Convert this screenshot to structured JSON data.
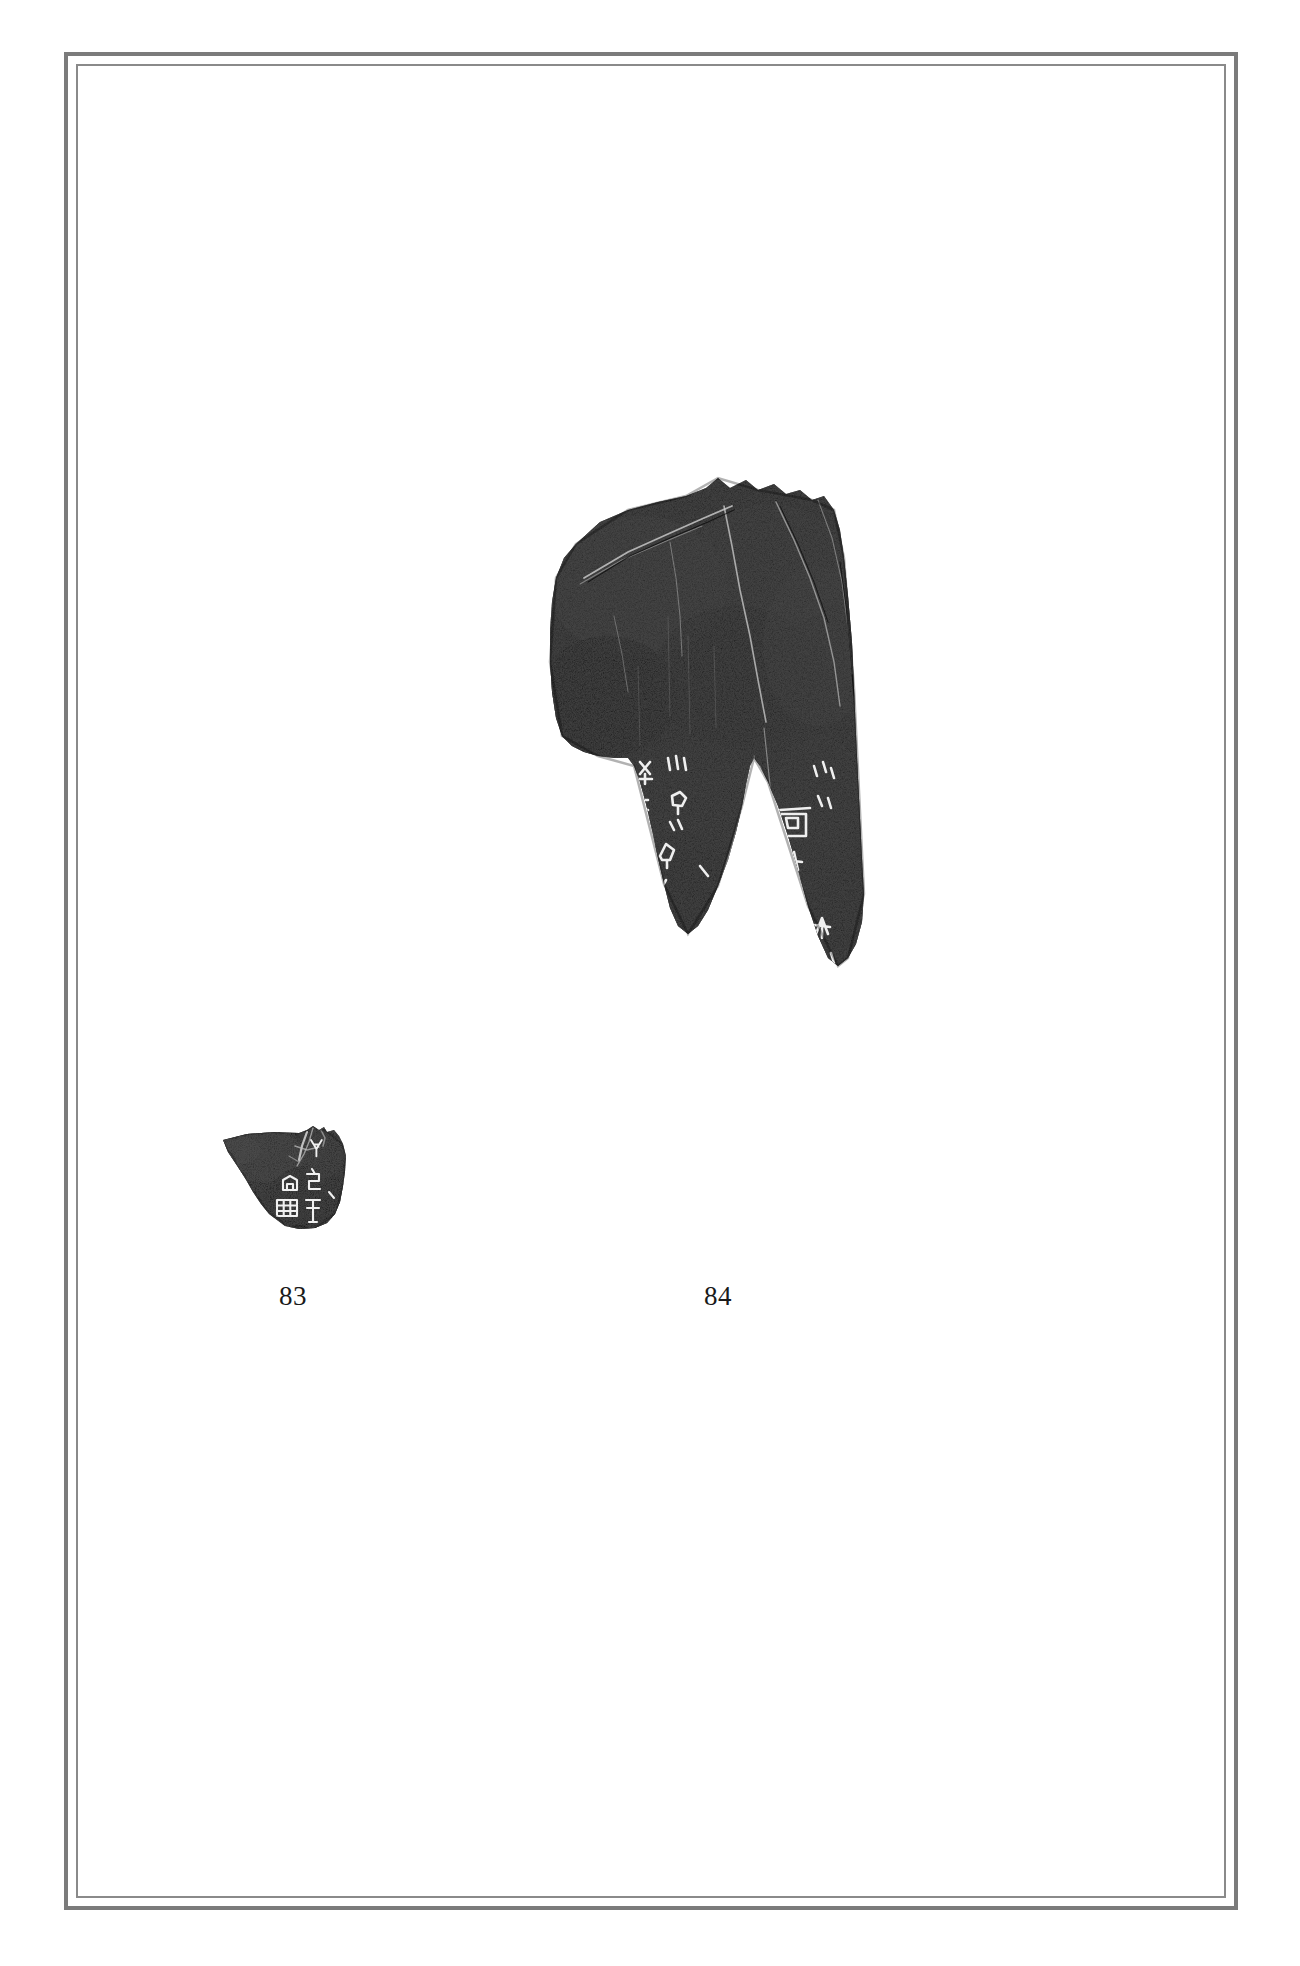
{
  "page": {
    "background_color": "#ffffff",
    "width": 1300,
    "height": 1966,
    "document_type": "plate-page"
  },
  "frame": {
    "style": "double-rule-border",
    "outer_color": "#7b7b7b",
    "inner_color": "#8a8a8a"
  },
  "figures": [
    {
      "id": "83",
      "caption": "83",
      "kind": "oracle-bone-rubbing",
      "size": "small",
      "position": "left",
      "ink_color": "#1d1d1d",
      "inscription_color": "#f2f2f2",
      "description": "Small angular bone fragment rubbing with a cluster of incised graphs at lower right",
      "glyph_count": 6
    },
    {
      "id": "84",
      "caption": "84",
      "kind": "oracle-bone-rubbing",
      "size": "large",
      "position": "right",
      "ink_color": "#1d1d1d",
      "inscription_color": "#f2f2f2",
      "description": "Large scapula fragment rubbing, broad above and splitting into two downward prongs separated by a V-notch; two columns of incised graphs in the lower half",
      "glyph_count": 14
    }
  ]
}
